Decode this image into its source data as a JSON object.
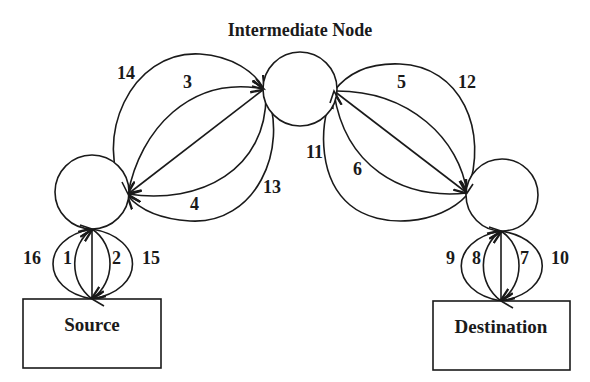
{
  "title": "Intermediate Node",
  "nodes": {
    "source": {
      "label": "Source"
    },
    "destination": {
      "label": "Destination"
    },
    "intermediate": {
      "label": "Intermediate Node"
    },
    "source_relay": {
      "label": ""
    },
    "destination_relay": {
      "label": ""
    }
  },
  "edge_labels": {
    "e1": "1",
    "e2": "2",
    "e3": "3",
    "e4": "4",
    "e5": "5",
    "e6": "6",
    "e7": "7",
    "e8": "8",
    "e9": "9",
    "e10": "10",
    "e11": "11",
    "e12": "12",
    "e13": "13",
    "e14": "14",
    "e15": "15",
    "e16": "16"
  },
  "colors": {
    "stroke": "#1a1a1a",
    "background": "#ffffff"
  }
}
